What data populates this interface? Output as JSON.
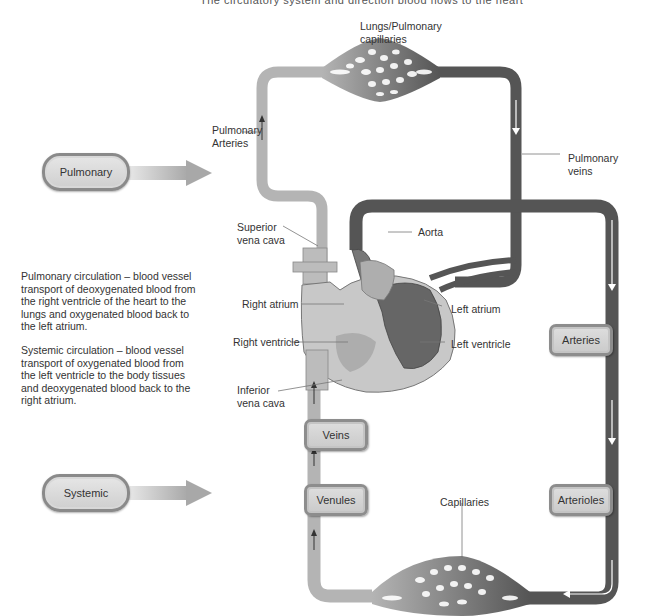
{
  "title_cut": "The circulatory system and direction blood flows to the heart",
  "circuits": {
    "pulmonary": {
      "label": "Pulmonary"
    },
    "systemic": {
      "label": "Systemic"
    }
  },
  "descriptions": {
    "pulmonary": "Pulmonary circulation – blood vessel transport of deoxygenated blood from the right ventricle of the heart to the lungs and oxygenated blood back to the left atrium.",
    "systemic": "Systemic circulation – blood vessel transport of oxygenated blood from the left ventricle to the body tissues and deoxygenated blood back to the right atrium."
  },
  "labels": {
    "lungs": [
      "Lungs/Pulmonary",
      "capillaries"
    ],
    "pulmonary_arteries": [
      "Pulmonary",
      "Arteries"
    ],
    "pulmonary_veins": [
      "Pulmonary",
      "veins"
    ],
    "superior_vena_cava": [
      "Superior",
      "vena cava"
    ],
    "aorta": "Aorta",
    "right_atrium": "Right atrium",
    "left_atrium": "Left atrium",
    "right_ventricle": "Right ventricle",
    "left_ventricle": "Left ventricle",
    "inferior_vena_cava": [
      "Inferior",
      "vena cava"
    ],
    "capillaries": "Capillaries"
  },
  "nodes": {
    "veins": "Veins",
    "venules": "Venules",
    "arteries": "Arteries",
    "arterioles": "Arterioles"
  },
  "colors": {
    "deoxygenated": "#b4b4b4",
    "oxygenated": "#555555",
    "node_fill": "#d4d4d4",
    "node_border": "#8d8d8d"
  }
}
